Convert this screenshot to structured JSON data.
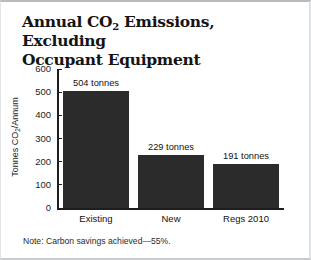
{
  "card": {
    "title_line1": "Annual CO2 Emissions, Excluding",
    "title_line2": "Occupant Equipment",
    "title_prefix": "Annual CO",
    "title_sub": "2",
    "title_rest": " Emissions, Excluding",
    "note": "Note: Carbon savings achieved—55%."
  },
  "axis": {
    "ylabel_prefix": "Tonnes CO",
    "ylabel_sub": "2",
    "ylabel_rest": "/Annum"
  },
  "chart_data": {
    "type": "bar",
    "categories": [
      "Existing",
      "New",
      "Regs 2010"
    ],
    "values": [
      504,
      229,
      191
    ],
    "value_labels": [
      "504 tonnes",
      "229 tonnes",
      "191 tonnes"
    ],
    "xlabel": "",
    "ylabel": "Tonnes CO2/Annum",
    "ylim": [
      0,
      600
    ],
    "yticks": [
      0,
      100,
      200,
      300,
      400,
      500,
      600
    ],
    "ytick_labels": [
      "0",
      "100",
      "200",
      "300",
      "400",
      "500",
      "600"
    ],
    "grid": false,
    "legend": false,
    "bar_color": "#2b2b2b",
    "axis_color": "#1d1d1d",
    "background": "#ffffff",
    "annotation": "Note: Carbon savings achieved—55%."
  }
}
